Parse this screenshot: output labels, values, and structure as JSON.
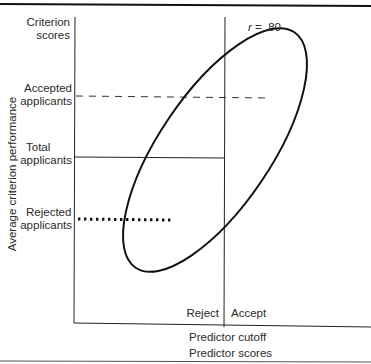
{
  "figure": {
    "y_axis_title": "Average criterion performance",
    "x_axis_title": "Predictor scores",
    "cutoff_label": "Predictor cutoff",
    "correlation_label": "r = .80",
    "correlation_symbol": "r",
    "correlation_value": "= .80",
    "region_left": "Reject",
    "region_right": "Accept",
    "y_labels": {
      "criterion_line1": "Criterion",
      "criterion_line2": "scores",
      "accepted_line1": "Accepted",
      "accepted_line2": "applicants",
      "total_line1": "Total",
      "total_line2": "applicants",
      "rejected_line1": "Rejected",
      "rejected_line2": "applicants"
    },
    "lines": [
      {
        "name": "accepted-applicants-mean",
        "style": "dashed"
      },
      {
        "name": "total-applicants-mean",
        "style": "solid"
      },
      {
        "name": "rejected-applicants-mean",
        "style": "dotted"
      }
    ],
    "colors": {
      "ink": "#111111",
      "text": "#2a2a2a",
      "background": "#ffffff"
    }
  }
}
